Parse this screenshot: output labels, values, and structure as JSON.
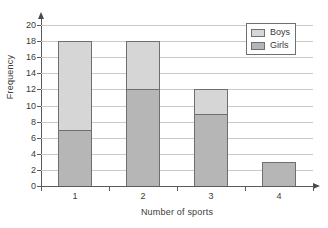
{
  "chart_data": {
    "type": "bar",
    "stacked": true,
    "title": "",
    "xlabel": "Number of sports",
    "ylabel": "Frequency",
    "categories": [
      "1",
      "2",
      "3",
      "4"
    ],
    "series": [
      {
        "name": "Girls",
        "color": "#b6b6b6",
        "values": [
          7,
          12,
          9,
          3
        ]
      },
      {
        "name": "Boys",
        "color": "#d6d6d6",
        "values": [
          11,
          6,
          3,
          0
        ]
      }
    ],
    "stack_totals": [
      18,
      18,
      12,
      3
    ],
    "ylim": [
      0,
      20
    ],
    "ytick_labels": [
      "0",
      "2",
      "4",
      "6",
      "8",
      "10",
      "12",
      "14",
      "16",
      "18",
      "20"
    ],
    "ytick_values": [
      0,
      2,
      4,
      6,
      8,
      10,
      12,
      14,
      16,
      18,
      20
    ],
    "xtick_labels": [
      "1",
      "2",
      "3",
      "4"
    ],
    "grid": true,
    "legend_position": "top-right",
    "legend_entries": [
      {
        "label": "Boys",
        "color": "#d6d6d6"
      },
      {
        "label": "Girls",
        "color": "#b6b6b6"
      }
    ],
    "colors": {
      "boys": "#d6d6d6",
      "girls": "#b6b6b6",
      "bar_outline": "#6f6f6f",
      "axis": "#5a5a5a",
      "gridline": "#c9c9c9",
      "text": "#3a3a3a",
      "background": "#ffffff"
    }
  }
}
